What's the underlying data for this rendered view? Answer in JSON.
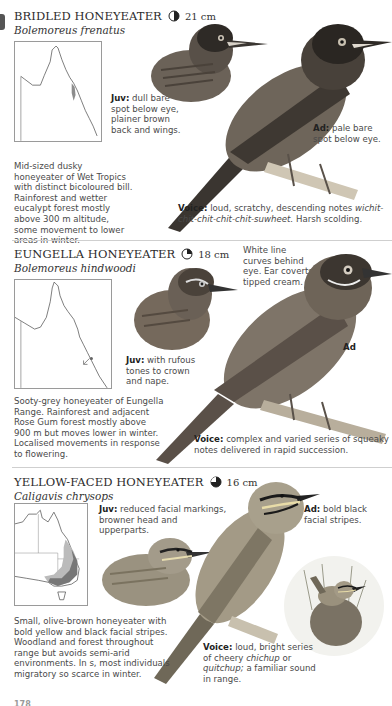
{
  "page": {
    "number": "178"
  },
  "species": [
    {
      "common_name": "BRIDLED HONEYEATER",
      "status_icon": "half-filled-circle-icon",
      "size": "21 cm",
      "scientific_name": "Bolemoreus frenatus",
      "map_region": "North-east Queensland (Wet Tropics)",
      "description": "Mid-sized dusky honeyeater of Wet Tropics with distinct bicoloured bill. Rainforest and wetter eucalypt forest mostly above 300 m altitude, some movement to lower areas in winter.",
      "juv": {
        "label": "Juv:",
        "text": "dull bare spot below eye, plainer brown back and wings."
      },
      "ad": {
        "label": "Ad:",
        "text": "pale bare spot below eye."
      },
      "voice": {
        "label": "Voice:",
        "text": "loud, scratchy, descending notes",
        "call": "wichit-chit-chit-chit-chit-suwheet.",
        "extra": "Harsh scolding."
      }
    },
    {
      "common_name": "EUNGELLA HONEYEATER",
      "status_icon": "quarter-filled-circle-icon",
      "size": "18 cm",
      "scientific_name": "Bolemoreus hindwoodi",
      "map_region": "Eungella Range, Queensland",
      "description": "Sooty-grey honeyeater of Eungella Range. Rainforest and adjacent Rose Gum forest mostly above 900 m but moves lower in winter. Localised movements in response to flowering.",
      "juv": {
        "label": "Juv:",
        "text": "with rufous tones to crown and nape."
      },
      "ad": {
        "label": "Ad",
        "text": ""
      },
      "head_note": "White line curves behind eye. Ear coverts tipped cream.",
      "voice": {
        "label": "Voice:",
        "text": "complex and varied series of squeaky notes delivered in rapid succession."
      }
    },
    {
      "common_name": "YELLOW-FACED HONEYEATER",
      "status_icon": "three-quarter-filled-circle-icon",
      "size": "16 cm",
      "scientific_name": "Caligavis chrysops",
      "map_region": "Eastern and south-eastern Australia",
      "description": "Small, olive-brown honeyeater with bold yellow and black facial stripes. Woodland and forest throughout range but avoids semi-arid environments. In s, most individuals migratory so scarce in winter.",
      "juv": {
        "label": "Juv:",
        "text": "reduced facial markings, browner head and upperparts."
      },
      "ad": {
        "label": "Ad:",
        "text": "bold black facial stripes."
      },
      "voice": {
        "label": "Voice:",
        "text": "loud, bright series of cheery",
        "call1": "chichup",
        "or": "or",
        "call2": "quitchup;",
        "extra": "a familiar sound in range."
      }
    }
  ],
  "colors": {
    "text": "#4a4a4a",
    "heading": "#2b2b2b",
    "divider": "#cfcfcf",
    "map_range": "#9a9a9a"
  }
}
